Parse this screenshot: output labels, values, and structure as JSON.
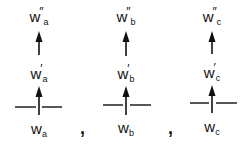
{
  "diagram": {
    "columns": [
      {
        "id": "a",
        "base": "w",
        "sub": "a",
        "prime1": "′",
        "prime2": "″"
      },
      {
        "id": "b",
        "base": "w",
        "sub": "b",
        "prime1": "′",
        "prime2": "″"
      },
      {
        "id": "c",
        "base": "w",
        "sub": "c",
        "prime1": "′",
        "prime2": "″"
      }
    ],
    "separator": ","
  }
}
